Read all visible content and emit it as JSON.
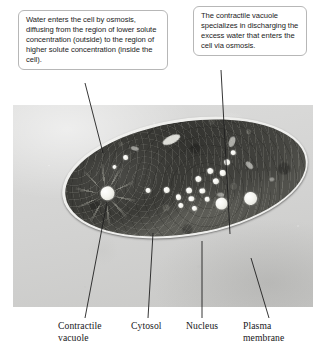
{
  "figure": {
    "photo_caption": "Pond water"
  },
  "callouts": [
    {
      "id": "osmosis-callout",
      "text": "Water enters the cell by osmosis, diffusing from the region of lower solute concentration (outside) to the region of higher solute concentration (inside the cell)."
    },
    {
      "id": "contractile-vacuole-callout",
      "text": "The contractile vacuole specializes in discharging the excess water that enters the cell via osmosis."
    }
  ],
  "labels": [
    {
      "id": "contractile-vacuole",
      "text": "Contractile vacuole"
    },
    {
      "id": "cytosol",
      "text": "Cytosol"
    },
    {
      "id": "nucleus",
      "text": "Nucleus"
    },
    {
      "id": "plasma-membrane",
      "text": "Plasma membrane"
    }
  ],
  "colors": {
    "page_background": "#ffffff",
    "photo_background": "#d4d4d3",
    "callout_border": "#b7b7b7",
    "leader_line": "#1f1f1f",
    "text": "#17171a",
    "cell_cytoplasm": "#4a4a45",
    "vacuole_highlight": "#ffffff"
  }
}
